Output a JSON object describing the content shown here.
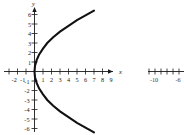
{
  "chart_data": {
    "type": "line",
    "title": "",
    "subtitle": "",
    "xlabel": "x",
    "ylabel": "y",
    "xlim": [
      -2.6,
      9.8
    ],
    "ylim": [
      -6.8,
      6.8
    ],
    "grid": false,
    "legend": null,
    "x_ticks": [
      -2,
      -1,
      1,
      2,
      3,
      4,
      5,
      6,
      7,
      8,
      9
    ],
    "x_tick_labels": [
      "-2",
      "-1",
      "1",
      "2",
      "3",
      "4",
      "5",
      "6",
      "7",
      "8",
      "9"
    ],
    "y_ticks": [
      -6,
      -5,
      -4,
      -3,
      -2,
      -1,
      1,
      2,
      3,
      4,
      5,
      6
    ],
    "y_tick_labels": [
      "-6",
      "-5",
      "-4",
      "-3",
      "-2",
      "-1",
      "1",
      "2",
      "3",
      "4",
      "5",
      "6"
    ],
    "series": [
      {
        "name": "parabola",
        "description": "sideways parabola opening right, vertex at origin",
        "equation": "x = y^2 / 7",
        "color": "#111111",
        "points": [
          {
            "x": 7.0,
            "y": 6.4
          },
          {
            "x": 6.0,
            "y": 5.9
          },
          {
            "x": 5.0,
            "y": 5.4
          },
          {
            "x": 4.0,
            "y": 4.8
          },
          {
            "x": 3.0,
            "y": 4.2
          },
          {
            "x": 2.2,
            "y": 3.6
          },
          {
            "x": 1.5,
            "y": 3.0
          },
          {
            "x": 1.0,
            "y": 2.4
          },
          {
            "x": 0.55,
            "y": 1.8
          },
          {
            "x": 0.25,
            "y": 1.2
          },
          {
            "x": 0.06,
            "y": 0.6
          },
          {
            "x": 0.0,
            "y": 0.0
          },
          {
            "x": 0.06,
            "y": -0.6
          },
          {
            "x": 0.25,
            "y": -1.2
          },
          {
            "x": 0.55,
            "y": -1.8
          },
          {
            "x": 1.0,
            "y": -2.4
          },
          {
            "x": 1.5,
            "y": -3.0
          },
          {
            "x": 2.2,
            "y": -3.6
          },
          {
            "x": 3.0,
            "y": -4.2
          },
          {
            "x": 4.0,
            "y": -4.8
          },
          {
            "x": 5.0,
            "y": -5.4
          },
          {
            "x": 6.0,
            "y": -5.9
          },
          {
            "x": 7.0,
            "y": -6.4
          }
        ]
      }
    ],
    "annotations": []
  },
  "axes": {
    "x_axis_name": "x",
    "y_axis_name": "y"
  },
  "side_fragment": {
    "description": "partial cropped number line at right edge",
    "tick_labels": [
      "-10",
      "-6"
    ],
    "label_minus_ten": "-10",
    "label_minus_six": "-6"
  }
}
